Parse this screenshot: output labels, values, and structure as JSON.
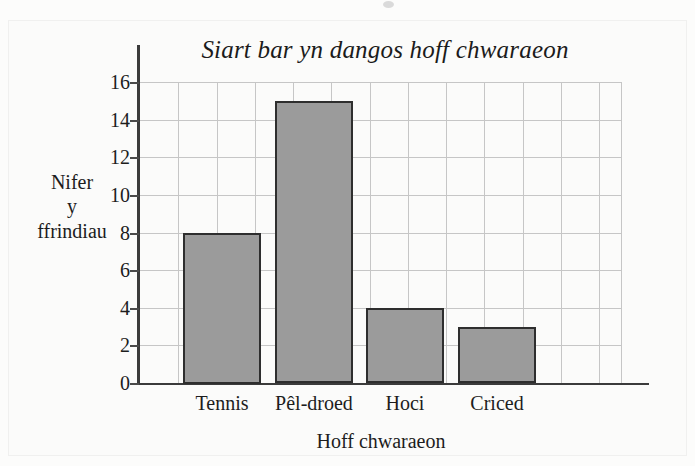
{
  "chart_data": {
    "type": "bar",
    "title": "Siart bar yn dangos hoff chwaraeon",
    "xlabel": "Hoff chwaraeon",
    "ylabel": "Nifer y ffrindiau",
    "ylabel_lines": [
      "Nifer",
      "y",
      "ffrindiau"
    ],
    "categories": [
      "Tennis",
      "Pêl-droed",
      "Hoci",
      "Criced"
    ],
    "values": [
      8,
      15,
      4,
      3
    ],
    "ylim": [
      0,
      16
    ],
    "ytick_labels": [
      "0",
      "2",
      "4",
      "6",
      "8",
      "10",
      "12",
      "14",
      "16"
    ],
    "ytick_values": [
      0,
      2,
      4,
      6,
      8,
      10,
      12,
      14,
      16
    ],
    "grid": "both",
    "legend": "none",
    "bar_fill_color": "#9b9b9b",
    "bar_edge_color": "#2e2e2e",
    "grid_color": "#c6c6c6",
    "axis_color": "#3b3b3b",
    "background_color": "#fbfbfa"
  }
}
